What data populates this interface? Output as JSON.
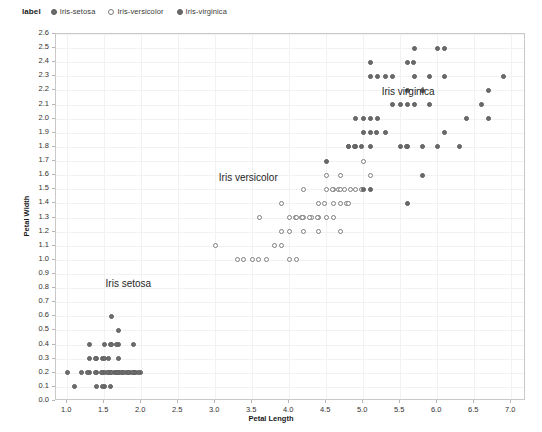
{
  "legend": {
    "title": "label",
    "items": [
      {
        "label": "Iris-setosa",
        "marker": "filled-circle-icon",
        "key": "setosa"
      },
      {
        "label": "Iris-versicolor",
        "marker": "open-circle-icon",
        "key": "versicolor"
      },
      {
        "label": "Iris-virginica",
        "marker": "filled-circle-icon",
        "key": "virginica"
      }
    ]
  },
  "annotations": [
    {
      "text": "Iris virginica",
      "x": 5.25,
      "y": 2.18
    },
    {
      "text": "Iris versicolor",
      "x": 3.05,
      "y": 1.57
    },
    {
      "text": "Iris setosa",
      "x": 1.52,
      "y": 0.82
    }
  ],
  "colors": {
    "marker_fill": "#6b6b6b",
    "marker_stroke": "#5c5c5c",
    "open_marker_stroke": "#7d7d7d",
    "grid": "#f2f2f2",
    "axis_border": "#c9c9c9",
    "text": "#1f1f1f",
    "background": "#ffffff"
  },
  "chart_data": {
    "type": "scatter",
    "title": "",
    "xlabel": "Petal Length",
    "ylabel": "Petal Width",
    "xlim": [
      0.85,
      7.2
    ],
    "ylim": [
      0.0,
      2.6
    ],
    "xticks": [
      1.0,
      1.5,
      2.0,
      2.5,
      3.0,
      3.5,
      4.0,
      4.5,
      5.0,
      5.5,
      6.0,
      6.5,
      7.0
    ],
    "yticks": [
      0.0,
      0.1,
      0.2,
      0.3,
      0.4,
      0.5,
      0.6,
      0.7,
      0.8,
      0.9,
      1.0,
      1.1,
      1.2,
      1.3,
      1.4,
      1.5,
      1.6,
      1.7,
      1.8,
      1.9,
      2.0,
      2.1,
      2.2,
      2.3,
      2.4,
      2.5,
      2.6
    ],
    "grid": true,
    "legend_position": "top-left-outside",
    "series": [
      {
        "name": "Iris-setosa",
        "marker": "filled-circle",
        "points": [
          [
            1.4,
            0.2
          ],
          [
            1.4,
            0.2
          ],
          [
            1.3,
            0.2
          ],
          [
            1.5,
            0.2
          ],
          [
            1.4,
            0.2
          ],
          [
            1.7,
            0.4
          ],
          [
            1.4,
            0.3
          ],
          [
            1.5,
            0.2
          ],
          [
            1.4,
            0.2
          ],
          [
            1.5,
            0.1
          ],
          [
            1.5,
            0.2
          ],
          [
            1.6,
            0.2
          ],
          [
            1.4,
            0.1
          ],
          [
            1.1,
            0.1
          ],
          [
            1.2,
            0.2
          ],
          [
            1.5,
            0.4
          ],
          [
            1.3,
            0.4
          ],
          [
            1.4,
            0.3
          ],
          [
            1.7,
            0.3
          ],
          [
            1.5,
            0.3
          ],
          [
            1.7,
            0.2
          ],
          [
            1.5,
            0.4
          ],
          [
            1.0,
            0.2
          ],
          [
            1.7,
            0.5
          ],
          [
            1.9,
            0.2
          ],
          [
            1.6,
            0.2
          ],
          [
            1.6,
            0.4
          ],
          [
            1.5,
            0.2
          ],
          [
            1.4,
            0.2
          ],
          [
            1.6,
            0.2
          ],
          [
            1.6,
            0.2
          ],
          [
            1.5,
            0.4
          ],
          [
            1.5,
            0.1
          ],
          [
            1.4,
            0.2
          ],
          [
            1.5,
            0.2
          ],
          [
            1.2,
            0.2
          ],
          [
            1.3,
            0.2
          ],
          [
            1.4,
            0.1
          ],
          [
            1.3,
            0.2
          ],
          [
            1.5,
            0.2
          ],
          [
            1.3,
            0.3
          ],
          [
            1.3,
            0.3
          ],
          [
            1.3,
            0.2
          ],
          [
            1.6,
            0.6
          ],
          [
            1.9,
            0.4
          ],
          [
            1.4,
            0.3
          ],
          [
            1.6,
            0.2
          ],
          [
            1.4,
            0.2
          ],
          [
            1.5,
            0.2
          ],
          [
            1.4,
            0.2
          ]
        ]
      },
      {
        "name": "Iris-versicolor",
        "marker": "open-circle",
        "points": [
          [
            4.7,
            1.4
          ],
          [
            4.5,
            1.5
          ],
          [
            4.9,
            1.5
          ],
          [
            4.0,
            1.3
          ],
          [
            4.6,
            1.5
          ],
          [
            4.5,
            1.3
          ],
          [
            4.7,
            1.6
          ],
          [
            3.3,
            1.0
          ],
          [
            4.6,
            1.3
          ],
          [
            3.9,
            1.4
          ],
          [
            3.5,
            1.0
          ],
          [
            4.2,
            1.5
          ],
          [
            4.0,
            1.0
          ],
          [
            4.7,
            1.4
          ],
          [
            3.6,
            1.3
          ],
          [
            4.4,
            1.4
          ],
          [
            4.5,
            1.5
          ],
          [
            4.1,
            1.0
          ],
          [
            4.5,
            1.5
          ],
          [
            3.9,
            1.1
          ],
          [
            4.8,
            1.8
          ],
          [
            4.0,
            1.3
          ],
          [
            4.9,
            1.5
          ],
          [
            4.7,
            1.2
          ],
          [
            4.3,
            1.3
          ],
          [
            4.4,
            1.4
          ],
          [
            4.8,
            1.4
          ],
          [
            5.0,
            1.7
          ],
          [
            4.5,
            1.5
          ],
          [
            3.5,
            1.0
          ],
          [
            3.8,
            1.1
          ],
          [
            3.7,
            1.0
          ],
          [
            3.9,
            1.2
          ],
          [
            5.1,
            1.6
          ],
          [
            4.5,
            1.5
          ],
          [
            4.5,
            1.6
          ],
          [
            4.7,
            1.5
          ],
          [
            4.4,
            1.3
          ],
          [
            4.1,
            1.3
          ],
          [
            4.0,
            1.3
          ],
          [
            4.4,
            1.2
          ],
          [
            4.6,
            1.4
          ],
          [
            4.0,
            1.2
          ],
          [
            3.3,
            1.0
          ],
          [
            4.2,
            1.3
          ],
          [
            4.2,
            1.2
          ],
          [
            4.2,
            1.3
          ],
          [
            4.3,
            1.3
          ],
          [
            3.0,
            1.1
          ],
          [
            4.1,
            1.3
          ]
        ]
      },
      {
        "name": "Iris-virginica",
        "marker": "filled-circle",
        "points": [
          [
            6.0,
            2.5
          ],
          [
            5.1,
            1.9
          ],
          [
            5.9,
            2.1
          ],
          [
            5.6,
            1.8
          ],
          [
            5.8,
            2.2
          ],
          [
            6.6,
            2.1
          ],
          [
            4.5,
            1.7
          ],
          [
            6.3,
            1.8
          ],
          [
            5.8,
            1.8
          ],
          [
            6.1,
            2.5
          ],
          [
            5.1,
            2.0
          ],
          [
            5.3,
            1.9
          ],
          [
            5.5,
            2.1
          ],
          [
            5.0,
            2.0
          ],
          [
            5.1,
            2.4
          ],
          [
            5.3,
            2.3
          ],
          [
            5.5,
            1.8
          ],
          [
            6.7,
            2.2
          ],
          [
            6.9,
            2.3
          ],
          [
            5.0,
            1.5
          ],
          [
            5.7,
            2.3
          ],
          [
            4.9,
            2.0
          ],
          [
            6.7,
            2.0
          ],
          [
            4.9,
            1.8
          ],
          [
            5.7,
            2.1
          ],
          [
            6.0,
            1.8
          ],
          [
            4.8,
            1.8
          ],
          [
            4.9,
            1.8
          ],
          [
            5.6,
            2.1
          ],
          [
            5.8,
            1.6
          ],
          [
            6.1,
            1.9
          ],
          [
            6.4,
            2.0
          ],
          [
            5.6,
            2.2
          ],
          [
            5.1,
            1.5
          ],
          [
            5.6,
            1.4
          ],
          [
            6.1,
            2.3
          ],
          [
            5.6,
            2.4
          ],
          [
            5.5,
            1.8
          ],
          [
            4.8,
            1.8
          ],
          [
            5.4,
            2.1
          ],
          [
            5.6,
            2.4
          ],
          [
            5.1,
            2.3
          ],
          [
            5.1,
            1.9
          ],
          [
            5.9,
            2.3
          ],
          [
            5.7,
            2.5
          ],
          [
            5.2,
            2.3
          ],
          [
            5.0,
            1.9
          ],
          [
            5.2,
            2.0
          ],
          [
            5.4,
            2.3
          ],
          [
            5.1,
            1.8
          ]
        ]
      }
    ]
  }
}
